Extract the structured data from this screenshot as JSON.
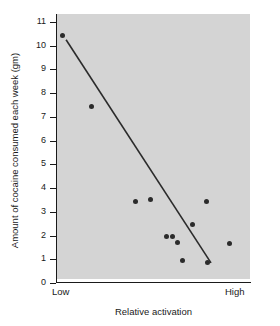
{
  "chart_data": {
    "type": "scatter",
    "title": "",
    "xlabel": "Relative activation",
    "ylabel": "Amount of cocaine consumed each week (gm)",
    "xlim": [
      0,
      10
    ],
    "ylim": [
      0,
      11
    ],
    "x_tick_labels": [
      "Low",
      "High"
    ],
    "y_tick_labels": [
      "0",
      "1",
      "2",
      "3",
      "4",
      "5",
      "6",
      "7",
      "8",
      "9",
      "10",
      "11"
    ],
    "y_ticks": [
      0,
      1,
      2,
      3,
      4,
      5,
      6,
      7,
      8,
      9,
      10,
      11
    ],
    "grid": false,
    "legend": "none",
    "panel_color": "#d4d4d4",
    "marker_color": "#2b2b2b",
    "line_color": "#2b2b2b",
    "points": [
      {
        "x": 0.26,
        "y": 10.45
      },
      {
        "x": 1.77,
        "y": 7.45
      },
      {
        "x": 4.09,
        "y": 3.45
      },
      {
        "x": 4.87,
        "y": 3.5
      },
      {
        "x": 5.65,
        "y": 1.95
      },
      {
        "x": 5.96,
        "y": 1.95
      },
      {
        "x": 6.22,
        "y": 1.7
      },
      {
        "x": 6.48,
        "y": 0.95
      },
      {
        "x": 7.04,
        "y": 2.45
      },
      {
        "x": 7.77,
        "y": 3.45
      },
      {
        "x": 7.82,
        "y": 0.88
      },
      {
        "x": 8.96,
        "y": 1.67
      }
    ],
    "trend_line": {
      "x1": 0.47,
      "y1": 10.25,
      "x2": 7.98,
      "y2": 0.85
    }
  }
}
